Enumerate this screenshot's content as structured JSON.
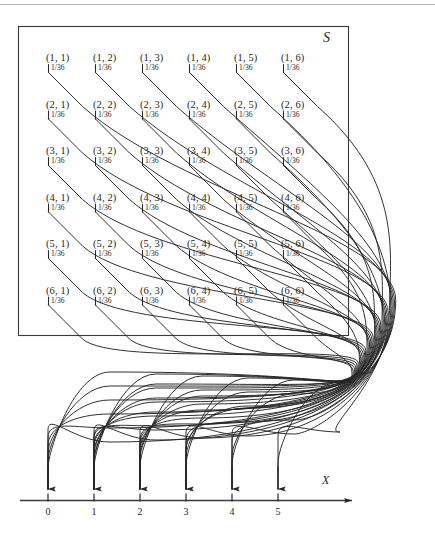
{
  "figure": {
    "type": "probability-mapping-diagram",
    "sample_space_symbol": "S",
    "random_variable_label": "X",
    "probability_text": "1/36",
    "line_color": "#262626",
    "box_border_color": "#3a3a3a",
    "top_rule_color": "#b0b0b3",
    "background_color": "#ffffff"
  },
  "sample_space": {
    "symbol": "S",
    "rows": [
      {
        "cells": [
          {
            "outcome": "(1, 1)",
            "probability": "1/36",
            "x_value": 0
          },
          {
            "outcome": "(1, 2)",
            "probability": "1/36",
            "x_value": 1
          },
          {
            "outcome": "(1, 3)",
            "probability": "1/36",
            "x_value": 2
          },
          {
            "outcome": "(1, 4)",
            "probability": "1/36",
            "x_value": 3
          },
          {
            "outcome": "(1, 5)",
            "probability": "1/36",
            "x_value": 4
          },
          {
            "outcome": "(1, 6)",
            "probability": "1/36",
            "x_value": 5
          }
        ]
      },
      {
        "cells": [
          {
            "outcome": "(2, 1)",
            "probability": "1/36",
            "x_value": 1
          },
          {
            "outcome": "(2, 2)",
            "probability": "1/36",
            "x_value": 0
          },
          {
            "outcome": "(2, 3)",
            "probability": "1/36",
            "x_value": 1
          },
          {
            "outcome": "(2, 4)",
            "probability": "1/36",
            "x_value": 2
          },
          {
            "outcome": "(2, 5)",
            "probability": "1/36",
            "x_value": 3
          },
          {
            "outcome": "(2, 6)",
            "probability": "1/36",
            "x_value": 4
          }
        ]
      },
      {
        "cells": [
          {
            "outcome": "(3, 1)",
            "probability": "1/36",
            "x_value": 2
          },
          {
            "outcome": "(3, 2)",
            "probability": "1/36",
            "x_value": 1
          },
          {
            "outcome": "(3, 3)",
            "probability": "1/36",
            "x_value": 0
          },
          {
            "outcome": "(3, 4)",
            "probability": "1/36",
            "x_value": 1
          },
          {
            "outcome": "(3, 5)",
            "probability": "1/36",
            "x_value": 2
          },
          {
            "outcome": "(3, 6)",
            "probability": "1/36",
            "x_value": 3
          }
        ]
      },
      {
        "cells": [
          {
            "outcome": "(4, 1)",
            "probability": "1/36",
            "x_value": 3
          },
          {
            "outcome": "(4, 2)",
            "probability": "1/36",
            "x_value": 2
          },
          {
            "outcome": "(4, 3)",
            "probability": "1/36",
            "x_value": 1
          },
          {
            "outcome": "(4, 4)",
            "probability": "1/36",
            "x_value": 0
          },
          {
            "outcome": "(4, 5)",
            "probability": "1/36",
            "x_value": 1
          },
          {
            "outcome": "(4, 6)",
            "probability": "1/36",
            "x_value": 2
          }
        ]
      },
      {
        "cells": [
          {
            "outcome": "(5, 1)",
            "probability": "1/36",
            "x_value": 4
          },
          {
            "outcome": "(5, 2)",
            "probability": "1/36",
            "x_value": 3
          },
          {
            "outcome": "(5, 3)",
            "probability": "1/36",
            "x_value": 2
          },
          {
            "outcome": "(5, 4)",
            "probability": "1/36",
            "x_value": 1
          },
          {
            "outcome": "(5, 5)",
            "probability": "1/36",
            "x_value": 0
          },
          {
            "outcome": "(5, 6)",
            "probability": "1/36",
            "x_value": 1
          }
        ]
      },
      {
        "cells": [
          {
            "outcome": "(6, 1)",
            "probability": "1/36",
            "x_value": 5
          },
          {
            "outcome": "(6, 2)",
            "probability": "1/36",
            "x_value": 4
          },
          {
            "outcome": "(6, 3)",
            "probability": "1/36",
            "x_value": 3
          },
          {
            "outcome": "(6, 4)",
            "probability": "1/36",
            "x_value": 2
          },
          {
            "outcome": "(6, 5)",
            "probability": "1/36",
            "x_value": 1
          },
          {
            "outcome": "(6, 6)",
            "probability": "1/36",
            "x_value": 0
          }
        ]
      }
    ]
  },
  "axis": {
    "variable_label": "X",
    "tick_labels": [
      "0",
      "1",
      "2",
      "3",
      "4",
      "5"
    ]
  },
  "chart_data": {
    "type": "diagram",
    "title": "",
    "xlabel": "X",
    "ylabel": "",
    "categories": [
      "0",
      "1",
      "2",
      "3",
      "4",
      "5"
    ],
    "values": [
      6,
      10,
      8,
      6,
      4,
      2
    ],
    "annotations": [
      "S",
      "1/36"
    ],
    "note": "Counts of the 36 outcomes mapping to each value of X"
  }
}
